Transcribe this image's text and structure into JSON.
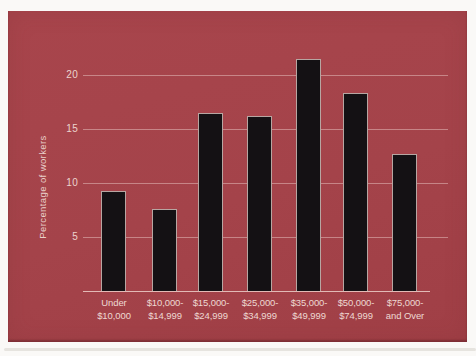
{
  "page": {
    "background": "#faf9f7"
  },
  "card": {
    "background": "#a4434a"
  },
  "chart_data": {
    "type": "bar",
    "title": "",
    "xlabel": "",
    "ylabel": "Percentage of workers",
    "categories": [
      "Under\n$10,000",
      "$10,000-\n$14,999",
      "$15,000-\n$24,999",
      "$25,000-\n$34,999",
      "$35,000-\n$49,999",
      "$50,000-\n$74,999",
      "$75,000-\nand Over"
    ],
    "values": [
      9.3,
      7.6,
      16.5,
      16.2,
      21.5,
      18.3,
      12.7
    ],
    "yticks": [
      5,
      10,
      15,
      20
    ],
    "ylim": [
      0,
      23
    ],
    "grid": "horizontal-only",
    "legend": "none",
    "bar_color": "#141114",
    "bar_edge_color": "#eed8d2",
    "grid_color": "#f2d8d2",
    "text_color": "#eed8d2"
  }
}
